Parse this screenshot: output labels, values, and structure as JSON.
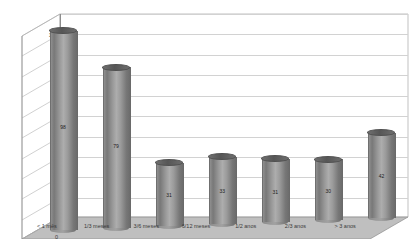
{
  "chart_data": {
    "type": "bar",
    "title": "",
    "xlabel": "",
    "ylabel": "",
    "categories": [
      "< 1 mês",
      "1/3 meses",
      "3/6 meses",
      "6/12 meses",
      "1/2 anos",
      "2/3 anos",
      "> 3 anos"
    ],
    "values": [
      98,
      79,
      31,
      33,
      31,
      30,
      42
    ],
    "ylim": [
      0,
      100
    ],
    "yticks": [
      0,
      10,
      20,
      30,
      40,
      50,
      60,
      70,
      80,
      90,
      100
    ],
    "grid": true,
    "legend": "none",
    "style": "3d-cylinder",
    "series": [
      {
        "name": "",
        "values": [
          98,
          79,
          31,
          33,
          31,
          30,
          42
        ]
      }
    ],
    "colors": {
      "bar": "#8f8f8f",
      "bar_top": "#5a5a5a",
      "gridline": "#d2d2d2",
      "axis": "#8d8d8d",
      "floor": "#bfbfbf",
      "plot_background": "#ffffff"
    }
  }
}
